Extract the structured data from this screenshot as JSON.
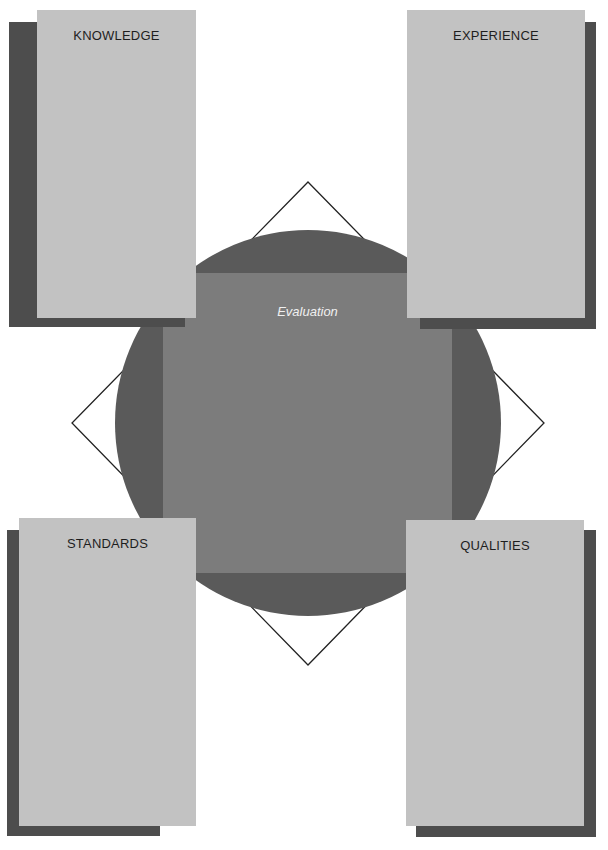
{
  "diagram": {
    "center": {
      "label": "Evaluation"
    },
    "cards": [
      {
        "id": "top-left",
        "title": "KNOWLEDGE"
      },
      {
        "id": "top-right",
        "title": "EXPERIENCE"
      },
      {
        "id": "bottom-left",
        "title": "STANDARDS"
      },
      {
        "id": "bottom-right",
        "title": "QUALITIES"
      }
    ],
    "colors": {
      "background": "#ffffff",
      "card_fill": "#c2c2c2",
      "card_shadow": "#4d4d4d",
      "circle_fill": "#5a5a5a",
      "inner_square_fill": "#7c7c7c",
      "diamond_stroke": "#222222",
      "center_label": "#f0f0f0",
      "card_title": "#1e1e1e"
    }
  }
}
